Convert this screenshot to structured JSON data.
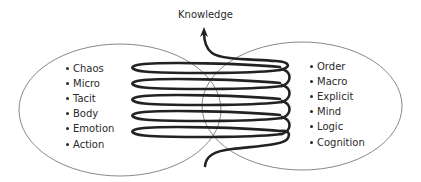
{
  "diagram": {
    "title": "Knowledge",
    "left_set": {
      "items": [
        "Chaos",
        "Micro",
        "Tacit",
        "Body",
        "Emotion",
        "Action"
      ]
    },
    "right_set": {
      "items": [
        "Order",
        "Macro",
        "Explicit",
        "Mind",
        "Logic",
        "Cognition"
      ]
    },
    "spiral": {
      "coils": 5,
      "direction": "upward",
      "arrow_label": "Knowledge"
    },
    "colors": {
      "ellipse_stroke": "#7a7a7a",
      "spiral_stroke": "#222222",
      "text": "#2a2a2a"
    }
  }
}
